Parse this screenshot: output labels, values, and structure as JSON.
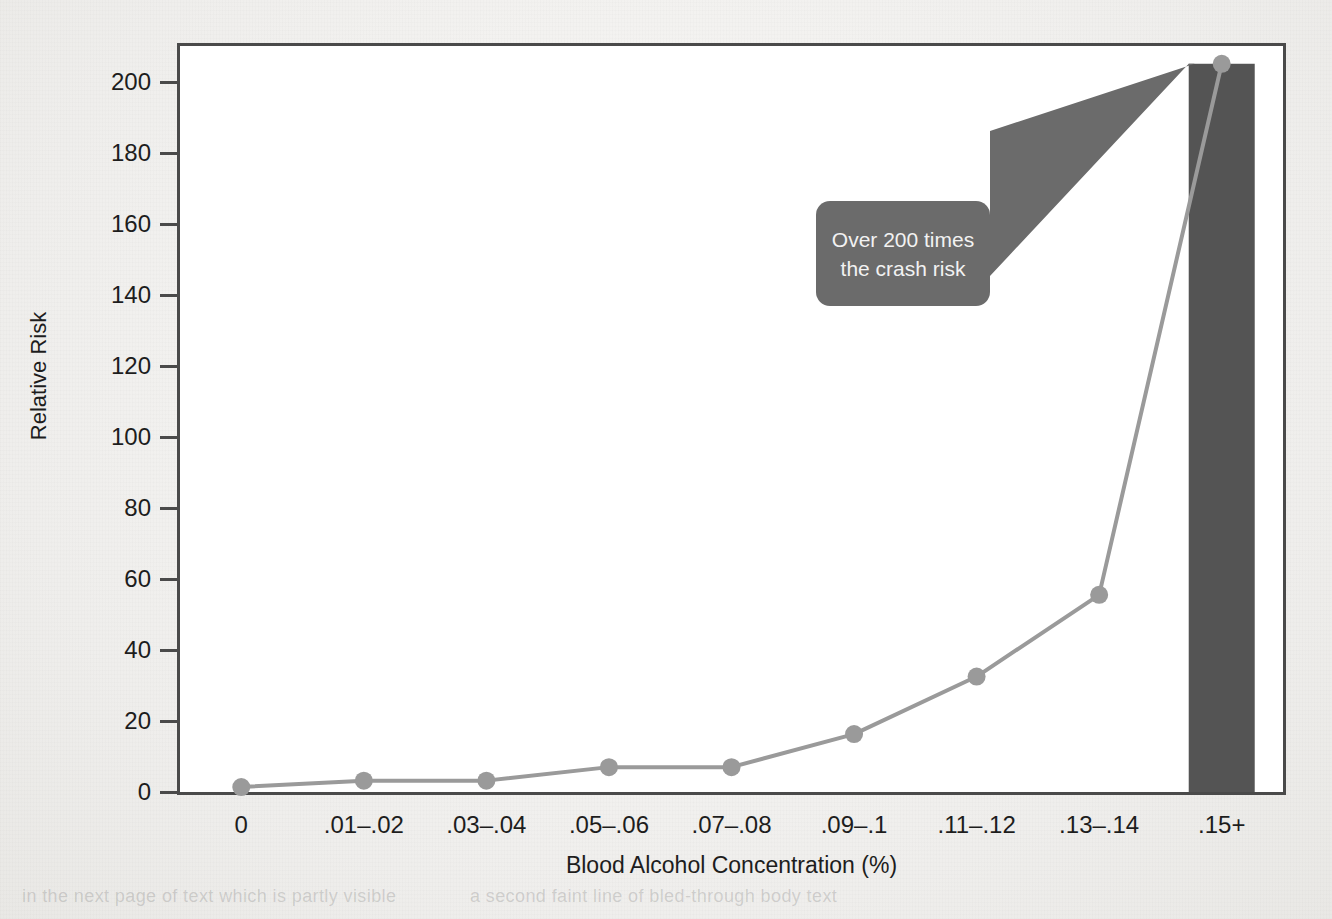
{
  "chart_data": {
    "type": "line",
    "title": "",
    "xlabel": "Blood Alcohol Concentration (%)",
    "ylabel": "Relative Risk",
    "categories": [
      "0",
      ".01–.02",
      ".03–.04",
      ".05–.06",
      ".07–.08",
      ".09–.1",
      ".11–.12",
      ".13–.14",
      ".15+"
    ],
    "values": [
      1.4,
      3.2,
      3.2,
      7,
      7,
      16.3,
      32.5,
      55.5,
      205
    ],
    "series": [
      {
        "name": "Relative Risk",
        "values": [
          1.4,
          3.2,
          3.2,
          7,
          7,
          16.3,
          32.5,
          55.5,
          205
        ]
      }
    ],
    "ylim": [
      0,
      210
    ],
    "yticks": [
      0,
      20,
      40,
      60,
      80,
      100,
      120,
      140,
      160,
      180,
      200
    ],
    "ytick_labels": [
      "0",
      "20",
      "40",
      "60",
      "80",
      "100",
      "120",
      "140",
      "160",
      "180",
      "200"
    ],
    "grid": false,
    "legend": "none",
    "highlight_bar": {
      "category": ".15+",
      "value": 205,
      "color": "#545454"
    },
    "annotations": [
      {
        "name": "callout",
        "lines": [
          "Over 200 times",
          "the crash risk"
        ],
        "target_category": ".15+",
        "target_value": 205,
        "fill": "#6b6b6b",
        "text_color": "#f2f2f2"
      }
    ],
    "colors": {
      "line": "#9a9a9a",
      "marker": "#9a9a9a",
      "bar": "#545454",
      "axis": "#4a4a4a",
      "plot_background": "#ffffff",
      "page_background": "#f2f1ef"
    }
  },
  "axes": {
    "y_title": "Relative Risk",
    "x_title": "Blood Alcohol Concentration (%)"
  },
  "callout": {
    "line1": "Over 200 times",
    "line2": "the crash risk"
  },
  "page_bleed": {
    "line1": "in the next page of text which is partly visible",
    "line2": "a second faint line of bled-through body text"
  }
}
